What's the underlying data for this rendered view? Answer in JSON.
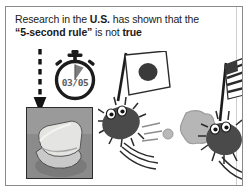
{
  "panel": {
    "headline": {
      "line1_a": "Research in the ",
      "line1_b": "U.S.",
      "line1_c": " has shown that the",
      "line2_a": "“5-second rule”",
      "line2_b": " is not ",
      "line2_c": "true"
    }
  },
  "stopwatch": {
    "display": "03/05",
    "icon": "stopwatch-icon"
  },
  "arrow": {
    "icon": "dashed-down-arrow-icon"
  },
  "photo": {
    "caption": "bread-slice-on-floor-photo"
  },
  "scene": {
    "left_character": {
      "name": "bacterium-with-japan-flag",
      "flag": "japan-flag-icon"
    },
    "right_character": {
      "name": "bacterium-with-usa-flag",
      "flag": "usa-flag-icon"
    },
    "projectile_small": "small-ball-icon",
    "projectile_large": "blob-icon",
    "motion": "motion-lines-icon"
  },
  "colors": {
    "ink": "#1a1a1a",
    "frame": "#8a8a8a",
    "divider": "#cfcfcf",
    "flag_red": "#c8252c",
    "bacteria_body": "#4a4a4a",
    "blob": "#b4b4b4"
  }
}
